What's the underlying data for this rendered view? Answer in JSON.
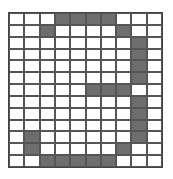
{
  "grid": {
    "rows": 13,
    "cols": 10,
    "filled_color": "#6e6e6e",
    "empty_color": "#ffffff",
    "line_color": "#555555",
    "filled": [
      [
        0,
        3
      ],
      [
        0,
        4
      ],
      [
        0,
        5
      ],
      [
        0,
        6
      ],
      [
        1,
        2
      ],
      [
        1,
        7
      ],
      [
        2,
        8
      ],
      [
        3,
        8
      ],
      [
        4,
        8
      ],
      [
        5,
        8
      ],
      [
        6,
        5
      ],
      [
        6,
        6
      ],
      [
        6,
        7
      ],
      [
        7,
        8
      ],
      [
        8,
        8
      ],
      [
        9,
        8
      ],
      [
        10,
        8
      ],
      [
        10,
        1
      ],
      [
        11,
        1
      ],
      [
        11,
        7
      ],
      [
        12,
        2
      ],
      [
        12,
        3
      ],
      [
        12,
        4
      ],
      [
        12,
        5
      ],
      [
        12,
        6
      ]
    ]
  }
}
